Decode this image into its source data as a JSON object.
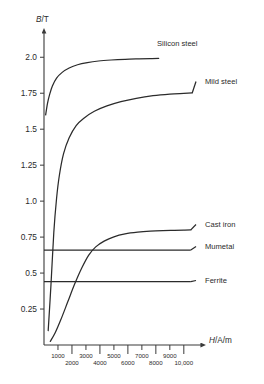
{
  "chart_data": {
    "type": "line",
    "title": "",
    "subtitle": "",
    "xlabel": "H/A/m",
    "ylabel": "B/T",
    "xlim": [
      0,
      10800
    ],
    "ylim": [
      0,
      2.12
    ],
    "grid": false,
    "legend_position": "right-inline-labels",
    "y_ticks": [
      0.25,
      0.5,
      0.75,
      1.0,
      1.25,
      1.5,
      1.75,
      2.0
    ],
    "y_tick_labels": [
      "0.25",
      "0.5",
      "0.75",
      "1.0",
      "1.25",
      "1.5",
      "1.75",
      "2.0"
    ],
    "x_ticks": [
      1000,
      2000,
      3000,
      4000,
      5000,
      6000,
      7000,
      8000,
      9000,
      10000
    ],
    "x_tick_labels_upper": [
      "1000",
      "3000",
      "5000",
      "7000",
      "9000"
    ],
    "x_tick_labels_lower": [
      "2000",
      "4000",
      "6000",
      "8000",
      "10,000"
    ],
    "x_tick_values_upper": [
      1000,
      3000,
      5000,
      7000,
      9000
    ],
    "x_tick_values_lower": [
      2000,
      4000,
      6000,
      8000,
      10000
    ],
    "series": [
      {
        "name": "Silicon steel",
        "kind": "saturation-curve",
        "label": "Silicon steel",
        "saturation_value": 2.0,
        "x": [
          120,
          250,
          400,
          600,
          900,
          1300,
          1800,
          2400,
          3100,
          3900,
          4800,
          5800,
          6800,
          7600,
          8200
        ],
        "y": [
          1.6,
          1.68,
          1.74,
          1.8,
          1.855,
          1.895,
          1.925,
          1.948,
          1.963,
          1.974,
          1.981,
          1.986,
          1.989,
          1.991,
          1.992
        ]
      },
      {
        "name": "Mild steel",
        "kind": "saturation-curve",
        "label": "Mild steel",
        "saturation_value": 1.75,
        "x": [
          300,
          500,
          700,
          900,
          1100,
          1400,
          1800,
          2300,
          2900,
          3600,
          4500,
          5500,
          6600,
          7800,
          9000,
          10000,
          10600
        ],
        "y": [
          0.1,
          0.42,
          0.78,
          1.02,
          1.18,
          1.33,
          1.44,
          1.525,
          1.58,
          1.625,
          1.662,
          1.692,
          1.715,
          1.733,
          1.744,
          1.749,
          1.752
        ]
      },
      {
        "name": "Cast iron",
        "kind": "saturation-curve",
        "label": "Cast iron",
        "saturation_value": 0.8,
        "x": [
          450,
          800,
          1200,
          1700,
          2200,
          2700,
          3200,
          3700,
          4300,
          5000,
          5800,
          6700,
          7600,
          8500,
          9300,
          10000,
          10500
        ],
        "y": [
          0.025,
          0.085,
          0.175,
          0.3,
          0.425,
          0.535,
          0.625,
          0.682,
          0.722,
          0.752,
          0.772,
          0.784,
          0.791,
          0.795,
          0.797,
          0.799,
          0.8
        ]
      },
      {
        "name": "Mumetal",
        "kind": "horizontal-line",
        "label": "Mumetal",
        "value": 0.66,
        "x_start": 0,
        "x_end": 10500
      },
      {
        "name": "Ferrite",
        "kind": "horizontal-line",
        "label": "Ferrite",
        "value": 0.44,
        "x_start": 0,
        "x_end": 10500
      }
    ],
    "colors": {
      "curve": "#2b2b2b",
      "axis": "#3a3a3a",
      "text": "#2b2b2b",
      "background": "#ffffff"
    }
  }
}
